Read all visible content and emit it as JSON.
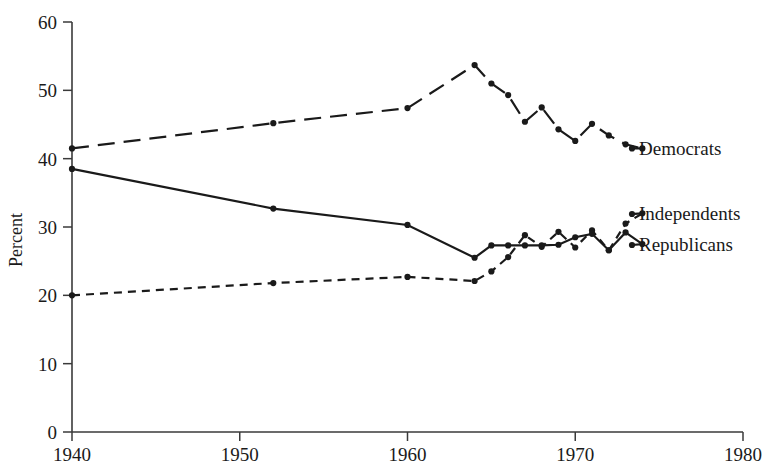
{
  "chart_data": {
    "type": "line",
    "title": "",
    "subtitle": "",
    "xlabel": "",
    "ylabel": "Percent",
    "xlim": [
      1940,
      1980
    ],
    "ylim": [
      0,
      60
    ],
    "grid": false,
    "legend": "inline-right-end-labels",
    "xticks": [
      "1940",
      "1950",
      "1960",
      "1970",
      "1980"
    ],
    "xtick_values": [
      1940,
      1950,
      1960,
      1970,
      1980
    ],
    "yticks": [
      "0",
      "10",
      "20",
      "30",
      "40",
      "50",
      "60"
    ],
    "ytick_values": [
      0,
      10,
      20,
      30,
      40,
      50,
      60
    ],
    "series": [
      {
        "name": "Democrats",
        "label": "Democrats",
        "style": "long-dash",
        "x": [
          1940,
          1952,
          1960,
          1964,
          1965,
          1966,
          1967,
          1968,
          1969,
          1970,
          1971,
          1972,
          1973,
          1974
        ],
        "values": [
          41.5,
          45.2,
          47.4,
          53.7,
          51.0,
          49.3,
          45.4,
          47.5,
          44.3,
          42.6,
          45.1,
          43.4,
          42.1,
          41.5
        ]
      },
      {
        "name": "Independents",
        "label": "Independents",
        "style": "short-dash",
        "x": [
          1940,
          1952,
          1960,
          1964,
          1965,
          1966,
          1967,
          1968,
          1969,
          1970,
          1971,
          1972,
          1973,
          1974
        ],
        "values": [
          20.0,
          21.8,
          22.7,
          22.1,
          23.5,
          25.6,
          28.8,
          27.1,
          29.3,
          27.0,
          29.5,
          26.6,
          30.5,
          32.0
        ]
      },
      {
        "name": "Republicans",
        "label": "Republicans",
        "style": "solid",
        "x": [
          1940,
          1952,
          1960,
          1964,
          1965,
          1966,
          1967,
          1968,
          1969,
          1970,
          1971,
          1972,
          1973,
          1974
        ],
        "values": [
          38.5,
          32.7,
          30.3,
          25.5,
          27.3,
          27.3,
          27.3,
          27.3,
          27.4,
          28.5,
          29.0,
          26.6,
          29.2,
          27.5
        ]
      }
    ]
  },
  "axis": {
    "y_title": "Percent"
  },
  "labels": {
    "democrats": "Democrats",
    "independents": "Independents",
    "republicans": "Republicans"
  }
}
